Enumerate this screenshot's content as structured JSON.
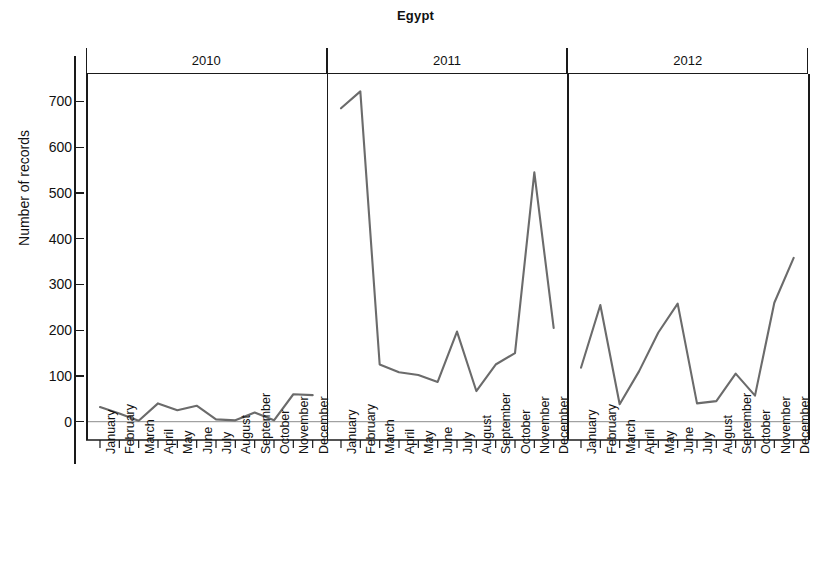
{
  "chart_data": {
    "type": "line",
    "title": "Egypt",
    "xlabel": "",
    "ylabel": "Number of records",
    "ylim": [
      -40,
      760
    ],
    "yticks": [
      0,
      100,
      200,
      300,
      400,
      500,
      600,
      700
    ],
    "grid": false,
    "legend": "none",
    "panel_layout": "horizontal-small-multiples",
    "categories": [
      "January",
      "February",
      "March",
      "April",
      "May",
      "June",
      "July",
      "August",
      "September",
      "October",
      "November",
      "December"
    ],
    "panels": [
      {
        "label": "2010",
        "values": [
          32,
          18,
          2,
          40,
          25,
          35,
          5,
          3,
          20,
          3,
          60,
          58
        ]
      },
      {
        "label": "2011",
        "values": [
          685,
          722,
          125,
          108,
          102,
          87,
          197,
          67,
          125,
          150,
          545,
          205
        ]
      },
      {
        "label": "2012",
        "values": [
          118,
          255,
          38,
          110,
          195,
          258,
          40,
          45,
          105,
          57,
          260,
          358
        ]
      }
    ],
    "colors": {
      "line": "#6b6b6b",
      "axis": "#1a1a1a",
      "baseline": "#8c8c8c",
      "background": "#ffffff"
    }
  }
}
